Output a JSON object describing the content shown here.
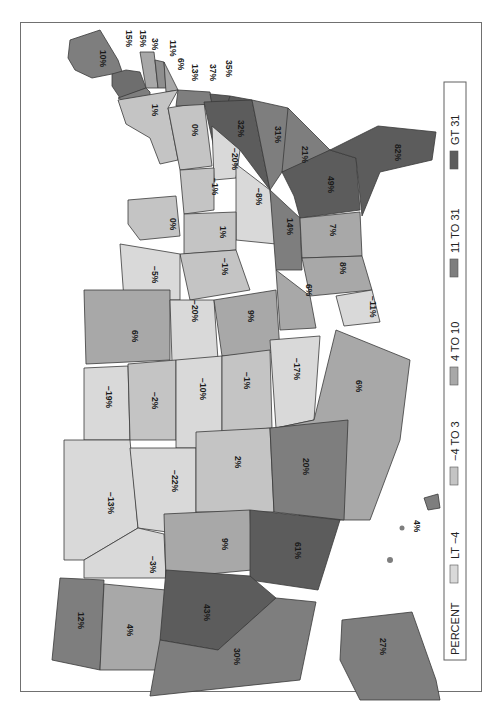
{
  "map": {
    "title": "PERCENT",
    "orientation": "rotated 90 degrees clockwise",
    "legend": {
      "title": "PERCENT",
      "classes": [
        {
          "label": "LT −4",
          "color": "#d9d9d9"
        },
        {
          "label": "−4 TO 3",
          "color": "#c4c4c4"
        },
        {
          "label": "4 TO 10",
          "color": "#a8a8a8"
        },
        {
          "label": "11 TO 31",
          "color": "#7e7e7e"
        },
        {
          "label": "GT 31",
          "color": "#5c5c5c"
        }
      ]
    },
    "states": [
      {
        "id": "ME",
        "value": "10%"
      },
      {
        "id": "NH",
        "value": "15%"
      },
      {
        "id": "VT",
        "value": "15%"
      },
      {
        "id": "MA",
        "value": "3%"
      },
      {
        "id": "RI",
        "value": "11%"
      },
      {
        "id": "CT",
        "value": "6%"
      },
      {
        "id": "NJ",
        "value": "13%"
      },
      {
        "id": "DE",
        "value": "37%"
      },
      {
        "id": "MD",
        "value": "35%"
      },
      {
        "id": "NY",
        "value": "1%"
      },
      {
        "id": "PA",
        "value": "0%"
      },
      {
        "id": "VA",
        "value": "32%"
      },
      {
        "id": "NC",
        "value": "31%"
      },
      {
        "id": "SC",
        "value": "21%"
      },
      {
        "id": "GA",
        "value": "49%"
      },
      {
        "id": "FL",
        "value": "82%"
      },
      {
        "id": "WV",
        "value": "−20%"
      },
      {
        "id": "OH",
        "value": "−1%"
      },
      {
        "id": "KY",
        "value": "−8%"
      },
      {
        "id": "TN",
        "value": "14%"
      },
      {
        "id": "AL",
        "value": "7%"
      },
      {
        "id": "MS",
        "value": "8%"
      },
      {
        "id": "MI",
        "value": "0%"
      },
      {
        "id": "IN",
        "value": "1%"
      },
      {
        "id": "IL",
        "value": "−1%"
      },
      {
        "id": "WI",
        "value": "−5%"
      },
      {
        "id": "AR",
        "value": "6%"
      },
      {
        "id": "LA",
        "value": "−11%"
      },
      {
        "id": "MN",
        "value": "6%"
      },
      {
        "id": "IA",
        "value": "−20%"
      },
      {
        "id": "MO",
        "value": "9%"
      },
      {
        "id": "ND",
        "value": "−19%"
      },
      {
        "id": "SD",
        "value": "−2%"
      },
      {
        "id": "NE",
        "value": "−10%"
      },
      {
        "id": "KS",
        "value": "−1%"
      },
      {
        "id": "OK",
        "value": "−17%"
      },
      {
        "id": "TX",
        "value": "6%"
      },
      {
        "id": "MT",
        "value": "−13%"
      },
      {
        "id": "WY",
        "value": "−22%"
      },
      {
        "id": "CO",
        "value": "2%"
      },
      {
        "id": "NM",
        "value": "20%"
      },
      {
        "id": "ID",
        "value": "−3%"
      },
      {
        "id": "UT",
        "value": "9%"
      },
      {
        "id": "AZ",
        "value": "61%"
      },
      {
        "id": "WA",
        "value": "12%"
      },
      {
        "id": "OR",
        "value": "4%"
      },
      {
        "id": "NV",
        "value": "43%"
      },
      {
        "id": "CA",
        "value": "30%"
      },
      {
        "id": "AK",
        "value": "27%"
      },
      {
        "id": "HI",
        "value": "4%"
      }
    ]
  }
}
